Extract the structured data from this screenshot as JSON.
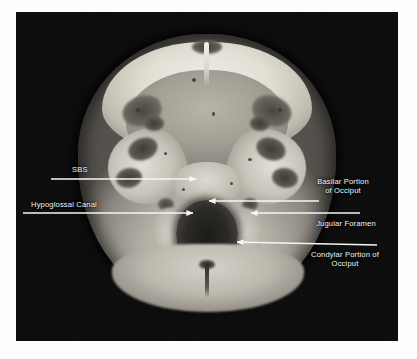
{
  "figure": {
    "type": "anatomical-photograph",
    "view": "axial section of skull base, inferior view",
    "border_color": "#ffffff",
    "plate_background": "#080808",
    "annotation_color": "#f6f6f6"
  },
  "labels": [
    {
      "id": "sbs",
      "text": "SBS",
      "side": "left",
      "text_x": 72,
      "text_y": 165,
      "line": {
        "x1": 51,
        "y1": 179,
        "x2": 196,
        "y2": 179,
        "arrow": "right"
      }
    },
    {
      "id": "hypoglossal-canal",
      "text": "Hypoglossal Canal",
      "side": "left",
      "text_x": 31,
      "text_y": 200,
      "line": {
        "x1": 23,
        "y1": 213,
        "x2": 193,
        "y2": 213,
        "arrow": "right"
      }
    },
    {
      "id": "basilar-portion-of-occiput",
      "text": "Basilar Portion\nof Occiput",
      "side": "right",
      "text_x": 310,
      "text_y": 177,
      "line": {
        "x1": 319,
        "y1": 201,
        "x2": 209,
        "y2": 201,
        "arrow": "left"
      }
    },
    {
      "id": "jugular-foramen",
      "text": "Jugular Foramen",
      "side": "right",
      "text_x": 310,
      "text_y": 219,
      "line": {
        "x1": 360,
        "y1": 213,
        "x2": 251,
        "y2": 213,
        "arrow": "left"
      }
    },
    {
      "id": "condylar-portion-of-occiput",
      "text": "Condylar Portion of\nOcciput",
      "side": "right",
      "text_x": 334,
      "text_y": 250,
      "line": {
        "x1": 377,
        "y1": 245,
        "x2": 237,
        "y2": 242,
        "arrow": "left"
      }
    }
  ],
  "structures": [
    "superior border of the sphenoid (SBS)",
    "hypoglossal canal",
    "basilar portion of occiput",
    "jugular foramen",
    "condylar portion of occiput",
    "foramen magnum"
  ]
}
